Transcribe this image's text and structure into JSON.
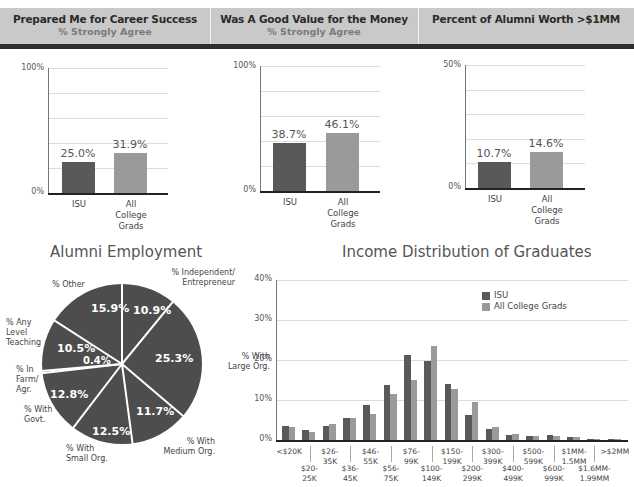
{
  "header": {
    "panels": [
      {
        "title": "Prepared Me for Career Success",
        "subtitle": "% Strongly Agree"
      },
      {
        "title": "Was A Good Value for the Money",
        "subtitle": "% Strongly Agree"
      },
      {
        "title": "Percent of Alumni Worth >$1MM",
        "subtitle": ""
      }
    ]
  },
  "colors": {
    "isu": "#595959",
    "all_college_grads": "#9a9a9a",
    "header_bg": "#c9c9c9",
    "header_bar": "#2e2e2e",
    "pie": "#4d4d4d"
  },
  "chart_data": [
    {
      "type": "bar",
      "title": "Prepared Me for Career Success",
      "subtitle": "% Strongly Agree",
      "categories": [
        "ISU",
        "All College Grads"
      ],
      "values": [
        25.0,
        31.9
      ],
      "value_labels": [
        "25.0%",
        "31.9%"
      ],
      "ylim": [
        0,
        100
      ],
      "ytick_labels": [
        "0%",
        "100%"
      ],
      "grid": true
    },
    {
      "type": "bar",
      "title": "Was A Good Value for the Money",
      "subtitle": "% Strongly Agree",
      "categories": [
        "ISU",
        "All College Grads"
      ],
      "values": [
        38.7,
        46.1
      ],
      "value_labels": [
        "38.7%",
        "46.1%"
      ],
      "ylim": [
        0,
        100
      ],
      "ytick_labels": [
        "0%",
        "100%"
      ],
      "grid": true
    },
    {
      "type": "bar",
      "title": "Percent of Alumni Worth >$1MM",
      "categories": [
        "ISU",
        "All College Grads"
      ],
      "values": [
        10.7,
        14.6
      ],
      "value_labels": [
        "10.7%",
        "14.6%"
      ],
      "ylim": [
        0,
        50
      ],
      "ytick_labels": [
        "0%",
        "50%"
      ],
      "grid": true
    },
    {
      "type": "pie",
      "title": "Alumni Employment",
      "slices": [
        {
          "label": "% Independent/ Entrepreneur",
          "value": 10.9,
          "value_label": "10.9%"
        },
        {
          "label": "% With Large Org.",
          "value": 25.3,
          "value_label": "25.3%"
        },
        {
          "label": "% With Medium Org.",
          "value": 11.7,
          "value_label": "11.7%"
        },
        {
          "label": "% With Small Org.",
          "value": 12.5,
          "value_label": "12.5%"
        },
        {
          "label": "% With Govt.",
          "value": 12.8,
          "value_label": "12.8%"
        },
        {
          "label": "% In Farm/ Agr.",
          "value": 0.4,
          "value_label": "0.4%"
        },
        {
          "label": "% Any Level Teaching",
          "value": 10.5,
          "value_label": "10.5%"
        },
        {
          "label": "% Other",
          "value": 15.9,
          "value_label": "15.9%"
        }
      ]
    },
    {
      "type": "bar",
      "title": "Income Distribution of Graduates",
      "xlabel": "",
      "ylabel": "",
      "ylim": [
        0,
        40
      ],
      "ytick_labels": [
        "0%",
        "10%",
        "20%",
        "30%",
        "40%"
      ],
      "grid": true,
      "legend_position": "upper right",
      "categories": [
        "<$20K",
        "$20-25K",
        "$26-35K",
        "$36-45K",
        "$46-55K",
        "$56-75K",
        "$76-99K",
        "$100-149K",
        "$150-199K",
        "$200-299K",
        "$300-399K",
        "$400-499K",
        "$500-599K",
        "$600-999K",
        "$1MM-1.5MM",
        "$1.6MM-1.99MM",
        ">$2MM"
      ],
      "series": [
        {
          "name": "ISU",
          "values": [
            3.4,
            2.4,
            3.5,
            5.6,
            8.8,
            13.7,
            21.2,
            19.7,
            13.9,
            6.3,
            2.8,
            1.3,
            1.1,
            1.2,
            0.8,
            0.2,
            0.3
          ]
        },
        {
          "name": "All College Grads",
          "values": [
            3.3,
            1.9,
            4.0,
            5.4,
            6.6,
            11.6,
            15.0,
            23.5,
            12.7,
            9.6,
            3.3,
            1.6,
            1.1,
            1.1,
            0.8,
            0.2,
            0.3
          ]
        }
      ]
    }
  ],
  "income_xlabels": {
    "top": [
      {
        "l1": "<$20K",
        "l2": ""
      },
      {
        "l1": "$26-",
        "l2": "35K"
      },
      {
        "l1": "$46-",
        "l2": "55K"
      },
      {
        "l1": "$76-",
        "l2": "99K"
      },
      {
        "l1": "$150-",
        "l2": "199K"
      },
      {
        "l1": "$300-",
        "l2": "399K"
      },
      {
        "l1": "$500-",
        "l2": "599K"
      },
      {
        "l1": "$1MM-",
        "l2": "1.5MM"
      },
      {
        "l1": ">$2MM",
        "l2": ""
      }
    ],
    "bottom": [
      {
        "l1": "$20-",
        "l2": "25K"
      },
      {
        "l1": "$36-",
        "l2": "45K"
      },
      {
        "l1": "$56-",
        "l2": "75K"
      },
      {
        "l1": "$100-",
        "l2": "149K"
      },
      {
        "l1": "$200-",
        "l2": "299K"
      },
      {
        "l1": "$400-",
        "l2": "499K"
      },
      {
        "l1": "$600-",
        "l2": "999K"
      },
      {
        "l1": "$1.6MM-",
        "l2": "1.99MM"
      }
    ]
  },
  "small_chart_xlabels": {
    "isu": "ISU",
    "all_l1": "All",
    "all_l2": "College",
    "all_l3": "Grads"
  }
}
